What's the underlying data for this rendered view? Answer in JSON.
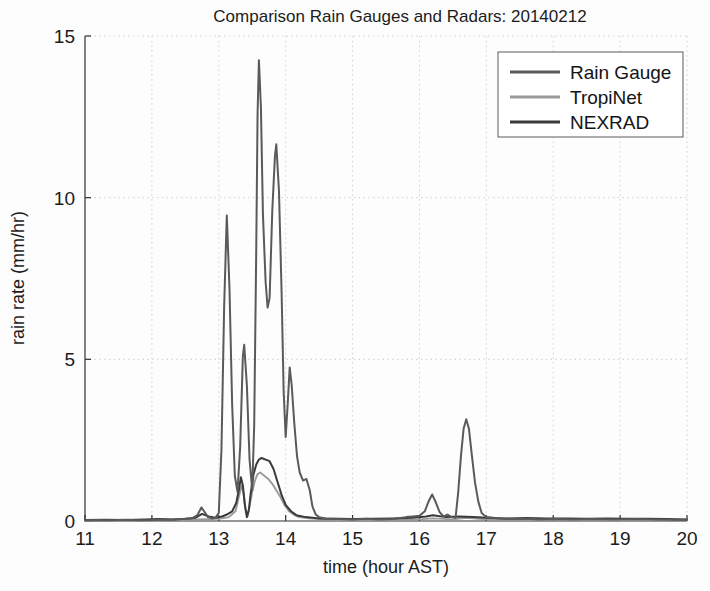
{
  "chart_data": {
    "type": "line",
    "title": "Comparison Rain Gauges and Radars: 20140212",
    "xlabel": "time (hour AST)",
    "ylabel": "rain rate (mm/hr)",
    "xlim": [
      11,
      20
    ],
    "ylim": [
      0,
      15
    ],
    "xticks": [
      11,
      12,
      13,
      14,
      15,
      16,
      17,
      18,
      19,
      20
    ],
    "yticks": [
      0,
      5,
      10,
      15
    ],
    "xtick_labels": [
      "11",
      "12",
      "13",
      "14",
      "15",
      "16",
      "17",
      "18",
      "19",
      "20"
    ],
    "ytick_labels": [
      "0",
      "5",
      "10",
      "15"
    ],
    "grid": true,
    "legend_position": "top-right",
    "series": [
      {
        "name": "Rain Gauge",
        "color": "#5a5a5a",
        "width": 2.0,
        "points": [
          [
            11.0,
            0.02
          ],
          [
            11.2,
            0.03
          ],
          [
            11.4,
            0.02
          ],
          [
            11.6,
            0.04
          ],
          [
            11.8,
            0.02
          ],
          [
            12.0,
            0.03
          ],
          [
            12.15,
            0.05
          ],
          [
            12.3,
            0.04
          ],
          [
            12.45,
            0.06
          ],
          [
            12.6,
            0.08
          ],
          [
            12.68,
            0.18
          ],
          [
            12.74,
            0.42
          ],
          [
            12.78,
            0.3
          ],
          [
            12.84,
            0.12
          ],
          [
            12.9,
            0.08
          ],
          [
            12.95,
            0.1
          ],
          [
            13.0,
            0.25
          ],
          [
            13.04,
            2.2
          ],
          [
            13.08,
            6.6
          ],
          [
            13.12,
            9.45
          ],
          [
            13.16,
            7.2
          ],
          [
            13.2,
            3.6
          ],
          [
            13.24,
            1.4
          ],
          [
            13.28,
            0.9
          ],
          [
            13.32,
            2.3
          ],
          [
            13.36,
            5.1
          ],
          [
            13.38,
            5.45
          ],
          [
            13.42,
            4.2
          ],
          [
            13.46,
            1.9
          ],
          [
            13.5,
            0.95
          ],
          [
            13.53,
            3.0
          ],
          [
            13.56,
            8.4
          ],
          [
            13.58,
            12.6
          ],
          [
            13.6,
            14.25
          ],
          [
            13.63,
            12.8
          ],
          [
            13.66,
            9.5
          ],
          [
            13.7,
            7.4
          ],
          [
            13.73,
            6.6
          ],
          [
            13.76,
            6.9
          ],
          [
            13.8,
            9.6
          ],
          [
            13.84,
            11.3
          ],
          [
            13.86,
            11.65
          ],
          [
            13.9,
            10.2
          ],
          [
            13.94,
            7.0
          ],
          [
            13.97,
            4.0
          ],
          [
            14.0,
            2.6
          ],
          [
            14.03,
            3.6
          ],
          [
            14.06,
            4.75
          ],
          [
            14.09,
            4.2
          ],
          [
            14.13,
            3.0
          ],
          [
            14.17,
            2.0
          ],
          [
            14.21,
            1.5
          ],
          [
            14.26,
            1.25
          ],
          [
            14.31,
            1.3
          ],
          [
            14.36,
            0.95
          ],
          [
            14.4,
            0.45
          ],
          [
            14.45,
            0.2
          ],
          [
            14.5,
            0.12
          ],
          [
            14.6,
            0.08
          ],
          [
            14.8,
            0.06
          ],
          [
            15.0,
            0.05
          ],
          [
            15.2,
            0.07
          ],
          [
            15.4,
            0.05
          ],
          [
            15.6,
            0.06
          ],
          [
            15.8,
            0.12
          ],
          [
            15.9,
            0.14
          ],
          [
            16.0,
            0.16
          ],
          [
            16.08,
            0.3
          ],
          [
            16.14,
            0.62
          ],
          [
            16.19,
            0.82
          ],
          [
            16.24,
            0.6
          ],
          [
            16.3,
            0.28
          ],
          [
            16.36,
            0.14
          ],
          [
            16.42,
            0.2
          ],
          [
            16.48,
            0.12
          ],
          [
            16.54,
            0.1
          ],
          [
            16.58,
            0.9
          ],
          [
            16.62,
            2.0
          ],
          [
            16.66,
            2.85
          ],
          [
            16.7,
            3.15
          ],
          [
            16.74,
            2.85
          ],
          [
            16.78,
            2.1
          ],
          [
            16.83,
            1.2
          ],
          [
            16.88,
            0.6
          ],
          [
            16.93,
            0.25
          ],
          [
            17.0,
            0.12
          ],
          [
            17.2,
            0.08
          ],
          [
            17.4,
            0.06
          ],
          [
            17.6,
            0.07
          ],
          [
            17.8,
            0.05
          ],
          [
            18.0,
            0.06
          ],
          [
            18.3,
            0.05
          ],
          [
            18.6,
            0.06
          ],
          [
            18.9,
            0.05
          ],
          [
            19.2,
            0.06
          ],
          [
            19.5,
            0.05
          ],
          [
            19.8,
            0.04
          ],
          [
            20.0,
            0.04
          ]
        ]
      },
      {
        "name": "TropiNet",
        "color": "#9a9a9a",
        "width": 1.9,
        "points": [
          [
            11.0,
            0.01
          ],
          [
            11.5,
            0.02
          ],
          [
            12.0,
            0.02
          ],
          [
            12.4,
            0.03
          ],
          [
            12.7,
            0.05
          ],
          [
            12.9,
            0.06
          ],
          [
            13.05,
            0.08
          ],
          [
            13.15,
            0.12
          ],
          [
            13.25,
            0.3
          ],
          [
            13.3,
            0.75
          ],
          [
            13.34,
            1.1
          ],
          [
            13.37,
            0.85
          ],
          [
            13.4,
            0.35
          ],
          [
            13.43,
            0.15
          ],
          [
            13.46,
            0.45
          ],
          [
            13.5,
            0.9
          ],
          [
            13.54,
            1.25
          ],
          [
            13.58,
            1.45
          ],
          [
            13.62,
            1.5
          ],
          [
            13.68,
            1.4
          ],
          [
            13.74,
            1.3
          ],
          [
            13.8,
            1.15
          ],
          [
            13.86,
            0.95
          ],
          [
            13.92,
            0.75
          ],
          [
            13.98,
            0.5
          ],
          [
            14.05,
            0.3
          ],
          [
            14.12,
            0.2
          ],
          [
            14.2,
            0.12
          ],
          [
            14.35,
            0.08
          ],
          [
            14.6,
            0.05
          ],
          [
            15.0,
            0.04
          ],
          [
            15.5,
            0.04
          ],
          [
            16.0,
            0.05
          ],
          [
            16.2,
            0.08
          ],
          [
            16.5,
            0.05
          ],
          [
            16.7,
            0.1
          ],
          [
            17.0,
            0.05
          ],
          [
            17.5,
            0.04
          ],
          [
            18.0,
            0.04
          ],
          [
            18.5,
            0.03
          ],
          [
            19.0,
            0.03
          ],
          [
            19.5,
            0.03
          ],
          [
            20.0,
            0.02
          ]
        ]
      },
      {
        "name": "NEXRAD",
        "color": "#3a3a3a",
        "width": 2.0,
        "points": [
          [
            11.0,
            0.03
          ],
          [
            11.3,
            0.04
          ],
          [
            11.6,
            0.03
          ],
          [
            11.9,
            0.05
          ],
          [
            12.1,
            0.06
          ],
          [
            12.3,
            0.05
          ],
          [
            12.5,
            0.07
          ],
          [
            12.65,
            0.1
          ],
          [
            12.75,
            0.22
          ],
          [
            12.85,
            0.14
          ],
          [
            12.95,
            0.1
          ],
          [
            13.05,
            0.14
          ],
          [
            13.12,
            0.2
          ],
          [
            13.2,
            0.3
          ],
          [
            13.26,
            0.55
          ],
          [
            13.3,
            0.95
          ],
          [
            13.33,
            1.35
          ],
          [
            13.36,
            1.1
          ],
          [
            13.39,
            0.5
          ],
          [
            13.42,
            0.12
          ],
          [
            13.45,
            0.35
          ],
          [
            13.48,
            0.9
          ],
          [
            13.52,
            1.45
          ],
          [
            13.56,
            1.75
          ],
          [
            13.6,
            1.9
          ],
          [
            13.64,
            1.95
          ],
          [
            13.7,
            1.9
          ],
          [
            13.76,
            1.85
          ],
          [
            13.82,
            1.6
          ],
          [
            13.88,
            1.2
          ],
          [
            13.94,
            0.8
          ],
          [
            14.0,
            0.5
          ],
          [
            14.08,
            0.3
          ],
          [
            14.16,
            0.18
          ],
          [
            14.3,
            0.12
          ],
          [
            14.5,
            0.08
          ],
          [
            14.8,
            0.07
          ],
          [
            15.0,
            0.06
          ],
          [
            15.3,
            0.07
          ],
          [
            15.6,
            0.08
          ],
          [
            15.9,
            0.1
          ],
          [
            16.1,
            0.14
          ],
          [
            16.2,
            0.18
          ],
          [
            16.4,
            0.12
          ],
          [
            16.6,
            0.14
          ],
          [
            16.8,
            0.12
          ],
          [
            17.0,
            0.1
          ],
          [
            17.3,
            0.08
          ],
          [
            17.6,
            0.09
          ],
          [
            17.9,
            0.08
          ],
          [
            18.2,
            0.08
          ],
          [
            18.5,
            0.07
          ],
          [
            18.8,
            0.08
          ],
          [
            19.1,
            0.07
          ],
          [
            19.4,
            0.07
          ],
          [
            19.7,
            0.06
          ],
          [
            20.0,
            0.05
          ]
        ]
      }
    ]
  },
  "legend": {
    "items": [
      {
        "label": "Rain Gauge"
      },
      {
        "label": "TropiNet"
      },
      {
        "label": "NEXRAD"
      }
    ]
  }
}
